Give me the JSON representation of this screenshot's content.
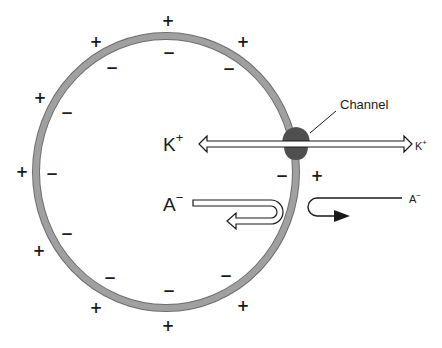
{
  "diagram": {
    "type": "cell membrane potential schematic",
    "cell": {
      "membrane_color": "#9a9a9a",
      "membrane_outline": "#6e6e6e",
      "fill": "#ffffff"
    },
    "channel": {
      "label": "Channel",
      "color": "#4f4f4f"
    },
    "ions": {
      "k_left": {
        "base": "K",
        "charge": "+"
      },
      "k_right": {
        "base": "K",
        "charge": "+"
      },
      "a_left": {
        "base": "A",
        "charge": "−"
      },
      "a_right": {
        "base": "A",
        "charge": "−"
      }
    },
    "outside_charges": [
      {
        "x": 168,
        "y": 21,
        "s": "+"
      },
      {
        "x": 96,
        "y": 42,
        "s": "+"
      },
      {
        "x": 243,
        "y": 42,
        "s": "+"
      },
      {
        "x": 40,
        "y": 98,
        "s": "+"
      },
      {
        "x": 22,
        "y": 172,
        "s": "+"
      },
      {
        "x": 317,
        "y": 176,
        "s": "+"
      },
      {
        "x": 39,
        "y": 251,
        "s": "+"
      },
      {
        "x": 96,
        "y": 308,
        "s": "+"
      },
      {
        "x": 243,
        "y": 306,
        "s": "+"
      },
      {
        "x": 168,
        "y": 326,
        "s": "+"
      }
    ],
    "inside_charges": [
      {
        "x": 169,
        "y": 53,
        "s": "−"
      },
      {
        "x": 112,
        "y": 68,
        "s": "−"
      },
      {
        "x": 229,
        "y": 69,
        "s": "−"
      },
      {
        "x": 67,
        "y": 113,
        "s": "−"
      },
      {
        "x": 52,
        "y": 174,
        "s": "−"
      },
      {
        "x": 282,
        "y": 176,
        "s": "−"
      },
      {
        "x": 67,
        "y": 234,
        "s": "−"
      },
      {
        "x": 110,
        "y": 278,
        "s": "−"
      },
      {
        "x": 226,
        "y": 276,
        "s": "−"
      },
      {
        "x": 169,
        "y": 291,
        "s": "−"
      }
    ],
    "colors": {
      "ink": "#1a1a1a",
      "arrow_outline": "#1a1a1a",
      "arrow_fill": "#ffffff"
    }
  }
}
